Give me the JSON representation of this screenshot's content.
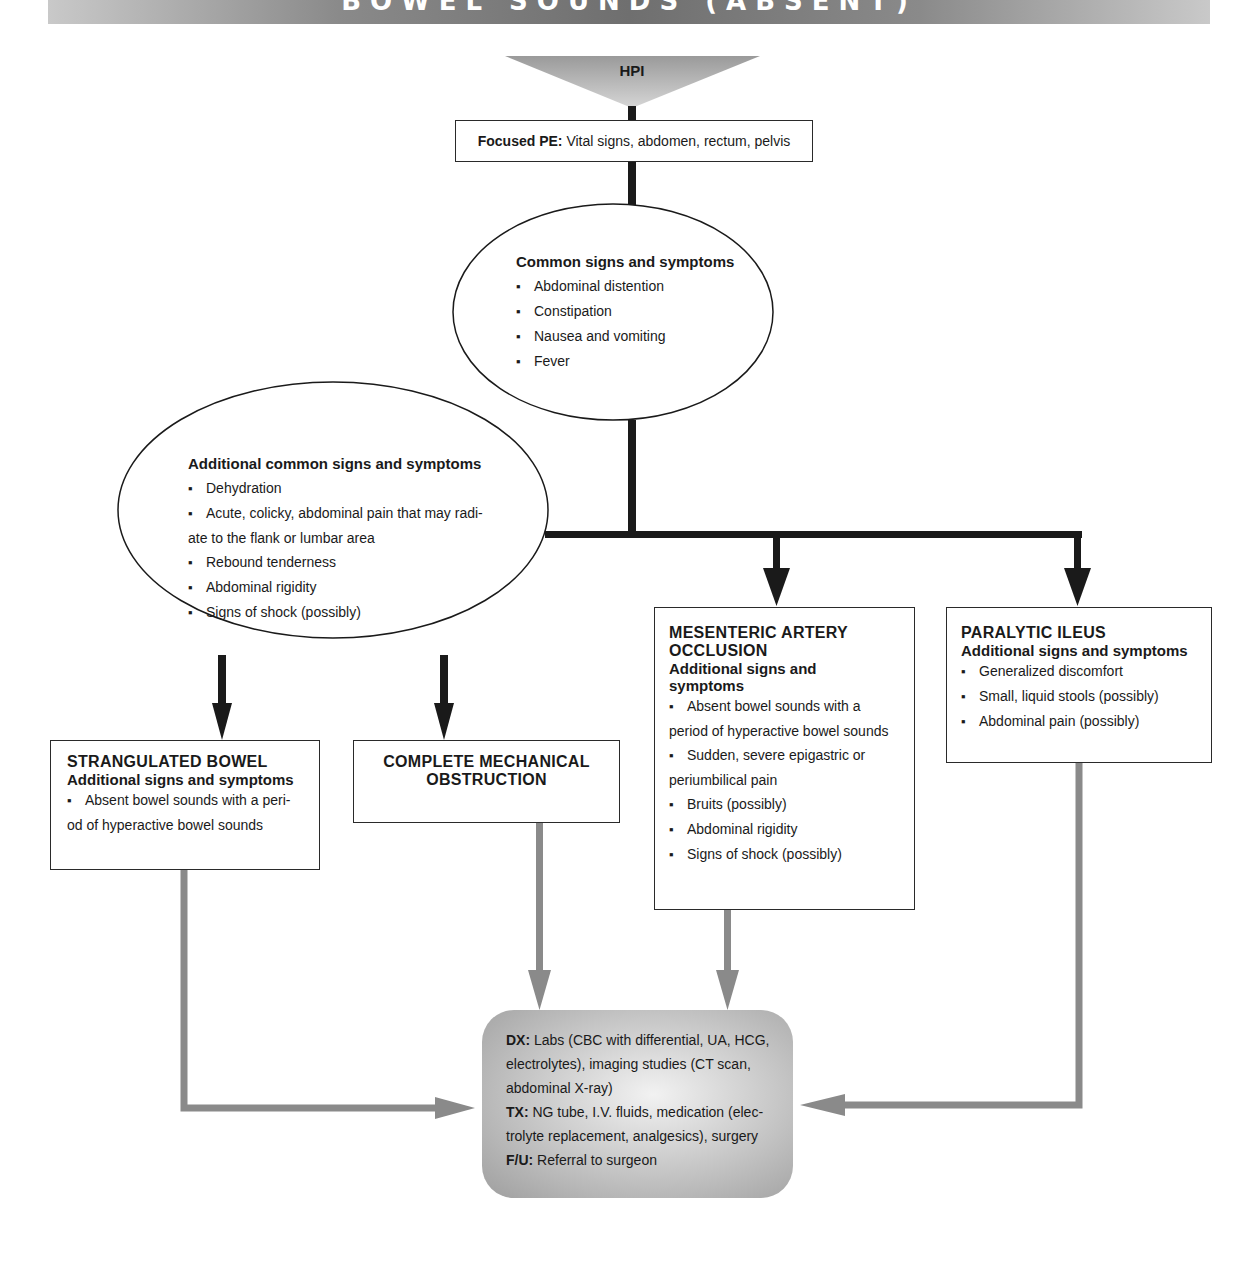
{
  "banner": {
    "title": "BOWEL SOUNDS (ABSENT)"
  },
  "hpi": {
    "label": "HPI"
  },
  "focused_pe": {
    "label": "Focused PE:",
    "text": "Vital signs, abdomen, rectum, pelvis"
  },
  "common": {
    "heading": "Common signs and symptoms",
    "items": [
      "Abdominal distention",
      "Constipation",
      "Nausea and vomiting",
      "Fever"
    ]
  },
  "additional_common": {
    "heading": "Additional common signs and symptoms",
    "items": [
      "Dehydration",
      "Acute, colicky, abdominal pain that may radi-",
      "ate to the flank or lumbar area",
      "Rebound tenderness",
      "Abdominal rigidity",
      "Signs of shock (possibly)"
    ]
  },
  "strangulated": {
    "title": "STRANGULATED BOWEL",
    "subtitle": "Additional signs and symptoms",
    "items": [
      "Absent bowel sounds with a peri-",
      "od of hyperactive bowel sounds"
    ]
  },
  "complete_mech": {
    "title_line1": "COMPLETE MECHANICAL",
    "title_line2": "OBSTRUCTION"
  },
  "mesenteric": {
    "title_line1": "MESENTERIC ARTERY",
    "title_line2": "OCCLUSION",
    "subtitle_line1": "Additional signs and",
    "subtitle_line2": "symptoms",
    "items": [
      "Absent bowel sounds with a",
      "period of hyperactive bowel sounds",
      "Sudden, severe epigastric or",
      "periumbilical pain",
      "Bruits (possibly)",
      "Abdominal rigidity",
      "Signs of shock (possibly)"
    ]
  },
  "paralytic": {
    "title": "PARALYTIC ILEUS",
    "subtitle": "Additional signs and symptoms",
    "items": [
      "Generalized discomfort",
      "Small, liquid stools (possibly)",
      "Abdominal pain (possibly)"
    ]
  },
  "outcome": {
    "dx_label": "DX:",
    "dx_line1": "Labs (CBC with differential, UA, HCG,",
    "dx_line2": "electrolytes), imaging studies (CT scan,",
    "dx_line3": "abdominal X-ray)",
    "tx_label": "TX:",
    "tx_line1": "NG tube, I.V. fluids, medication (elec-",
    "tx_line2": "trolyte replacement, analgesics), surgery",
    "fu_label": "F/U:",
    "fu_text": "Referral to surgeon"
  },
  "colors": {
    "arrow_dark": "#1a1a1a",
    "arrow_gray": "#8a8a8a",
    "banner": "#7a7a7a",
    "dx_fill": "#c4c4c4"
  }
}
